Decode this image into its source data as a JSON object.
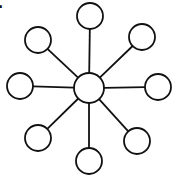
{
  "label": ".",
  "diagram": {
    "type": "star-graph",
    "stroke_color": "#111111",
    "fill_color": "#ffffff",
    "center": {
      "cx": 89,
      "cy": 88,
      "r": 15
    },
    "satellites": [
      {
        "name": "top",
        "cx": 90,
        "cy": 16,
        "r": 13
      },
      {
        "name": "top-right",
        "cx": 142,
        "cy": 37,
        "r": 13
      },
      {
        "name": "right",
        "cx": 158,
        "cy": 87,
        "r": 13
      },
      {
        "name": "bottom-right",
        "cx": 137,
        "cy": 141,
        "r": 13
      },
      {
        "name": "bottom",
        "cx": 89,
        "cy": 161,
        "r": 13
      },
      {
        "name": "bottom-left",
        "cx": 38,
        "cy": 138,
        "r": 13
      },
      {
        "name": "left",
        "cx": 20,
        "cy": 86,
        "r": 13
      },
      {
        "name": "top-left",
        "cx": 38,
        "cy": 40,
        "r": 13
      }
    ]
  }
}
